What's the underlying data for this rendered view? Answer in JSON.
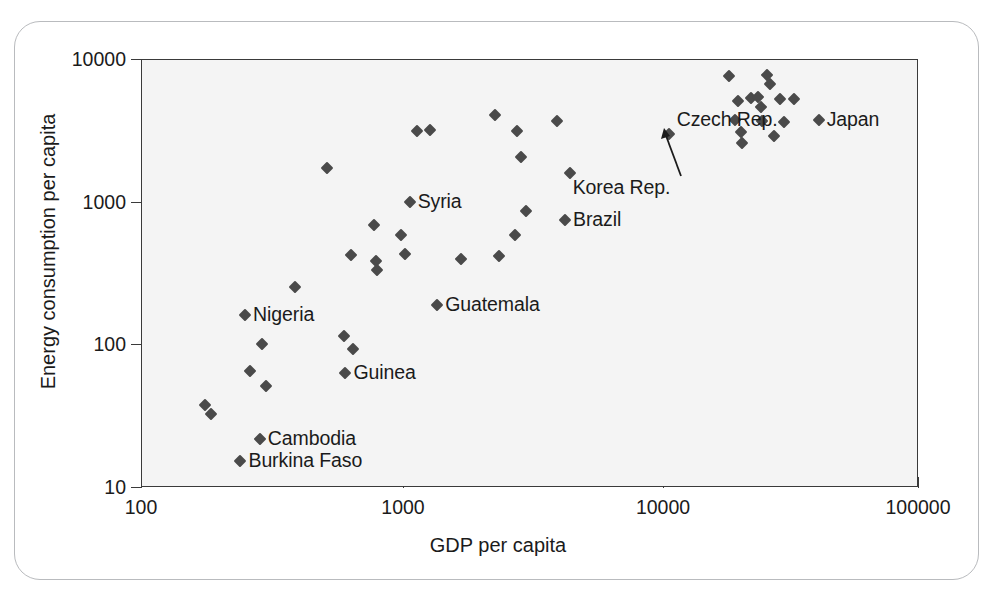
{
  "chart_data": {
    "type": "scatter",
    "title": "",
    "xlabel": "GDP per capita",
    "ylabel": "Energy consumption per capita",
    "xscale": "log",
    "yscale": "log",
    "xlim": [
      100,
      100000
    ],
    "ylim": [
      10,
      10000
    ],
    "xticks": [
      "100",
      "1000",
      "10000",
      "100000"
    ],
    "yticks": [
      "10",
      "100",
      "1000",
      "10000"
    ],
    "grid": false,
    "legend": "none",
    "marker_color": "#4a4a4a",
    "plot_bg": "#f4f4f4",
    "points": [
      {
        "label": "",
        "gdp": 175,
        "energy": 38
      },
      {
        "label": "",
        "gdp": 185,
        "energy": 33
      },
      {
        "label": "Burkina Faso",
        "gdp": 240,
        "energy": 15.5
      },
      {
        "label": "",
        "gdp": 250,
        "energy": 162,
        "name_label": "Nigeria"
      },
      {
        "label": "",
        "gdp": 262,
        "energy": 66
      },
      {
        "label": "Cambodia",
        "gdp": 285,
        "energy": 22
      },
      {
        "label": "",
        "gdp": 290,
        "energy": 103
      },
      {
        "label": "",
        "gdp": 300,
        "energy": 52
      },
      {
        "label": "",
        "gdp": 390,
        "energy": 255
      },
      {
        "label": "",
        "gdp": 520,
        "energy": 1740
      },
      {
        "label": "",
        "gdp": 600,
        "energy": 116
      },
      {
        "label": "Guinea",
        "gdp": 610,
        "energy": 64
      },
      {
        "label": "",
        "gdp": 640,
        "energy": 430
      },
      {
        "label": "",
        "gdp": 650,
        "energy": 95
      },
      {
        "label": "",
        "gdp": 790,
        "energy": 700
      },
      {
        "label": "",
        "gdp": 800,
        "energy": 390
      },
      {
        "label": "",
        "gdp": 810,
        "energy": 340
      },
      {
        "label": "",
        "gdp": 1000,
        "energy": 590
      },
      {
        "label": "",
        "gdp": 1040,
        "energy": 440
      },
      {
        "label": "Syria",
        "gdp": 1080,
        "energy": 1010
      },
      {
        "label": "",
        "gdp": 1150,
        "energy": 3200
      },
      {
        "label": "",
        "gdp": 1290,
        "energy": 3250
      },
      {
        "label": "Guatemala",
        "gdp": 1380,
        "energy": 193
      },
      {
        "label": "",
        "gdp": 1700,
        "energy": 405
      },
      {
        "label": "",
        "gdp": 2300,
        "energy": 4100
      },
      {
        "label": "",
        "gdp": 2380,
        "energy": 420
      },
      {
        "label": "",
        "gdp": 2750,
        "energy": 590
      },
      {
        "label": "",
        "gdp": 2800,
        "energy": 3200
      },
      {
        "label": "",
        "gdp": 2900,
        "energy": 2100
      },
      {
        "label": "",
        "gdp": 3050,
        "energy": 870
      },
      {
        "label": "",
        "gdp": 4000,
        "energy": 3750
      },
      {
        "label": "Brazil",
        "gdp": 4300,
        "energy": 760
      },
      {
        "label": "",
        "gdp": 4500,
        "energy": 1620
      },
      {
        "label": "Czech Rep.",
        "gdp": 10800,
        "energy": 3050
      },
      {
        "label": "",
        "gdp": 18500,
        "energy": 7700
      },
      {
        "label": "",
        "gdp": 19500,
        "energy": 3800
      },
      {
        "label": "",
        "gdp": 20000,
        "energy": 5200
      },
      {
        "label": "",
        "gdp": 20500,
        "energy": 3150
      },
      {
        "label": "",
        "gdp": 20800,
        "energy": 2600
      },
      {
        "label": "",
        "gdp": 22500,
        "energy": 5400
      },
      {
        "label": "",
        "gdp": 24000,
        "energy": 5500
      },
      {
        "label": "",
        "gdp": 24500,
        "energy": 4700
      },
      {
        "label": "",
        "gdp": 24800,
        "energy": 3750
      },
      {
        "label": "",
        "gdp": 26000,
        "energy": 7800
      },
      {
        "label": "",
        "gdp": 26500,
        "energy": 6800
      },
      {
        "label": "",
        "gdp": 27500,
        "energy": 2950
      },
      {
        "label": "",
        "gdp": 29000,
        "energy": 5350
      },
      {
        "label": "",
        "gdp": 30000,
        "energy": 3700
      },
      {
        "label": "",
        "gdp": 33000,
        "energy": 5300
      },
      {
        "label": "Japan",
        "gdp": 41000,
        "energy": 3800
      }
    ],
    "annotations": [
      {
        "text": "Nigeria",
        "target_gdp": 250,
        "target_energy": 162,
        "placement": "right"
      },
      {
        "text": "Cambodia",
        "target_gdp": 285,
        "target_energy": 22,
        "placement": "right"
      },
      {
        "text": "Burkina Faso",
        "target_gdp": 240,
        "target_energy": 15.5,
        "placement": "right"
      },
      {
        "text": "Guinea",
        "target_gdp": 610,
        "target_energy": 64,
        "placement": "right"
      },
      {
        "text": "Syria",
        "target_gdp": 1080,
        "target_energy": 1010,
        "placement": "right"
      },
      {
        "text": "Guatemala",
        "target_gdp": 1380,
        "target_energy": 193,
        "placement": "right"
      },
      {
        "text": "Brazil",
        "target_gdp": 4300,
        "target_energy": 760,
        "placement": "right"
      },
      {
        "text": "Czech Rep.",
        "target_gdp": 10800,
        "target_energy": 3050,
        "placement": "above-left"
      },
      {
        "text": "Korea Rep.",
        "target_gdp": 10800,
        "target_energy": 3050,
        "placement": "below-arrow"
      },
      {
        "text": "Japan",
        "target_gdp": 41000,
        "target_energy": 3800,
        "placement": "right"
      }
    ]
  },
  "axes": {
    "x_title": "GDP per capita",
    "y_title": "Energy consumption per capita",
    "x_tick_labels": [
      "100",
      "1000",
      "10000",
      "100000"
    ],
    "y_tick_labels": [
      "10000",
      "1000",
      "100",
      "10"
    ]
  },
  "labels": {
    "nigeria": "Nigeria",
    "cambodia": "Cambodia",
    "burkina_faso": "Burkina Faso",
    "guinea": "Guinea",
    "syria": "Syria",
    "guatemala": "Guatemala",
    "brazil": "Brazil",
    "czech_rep": "Czech Rep.",
    "korea_rep": "Korea Rep.",
    "japan": "Japan"
  }
}
